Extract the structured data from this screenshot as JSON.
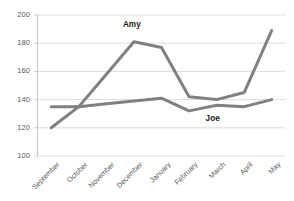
{
  "chart_data": {
    "type": "line",
    "title": "",
    "xlabel": "",
    "ylabel": "",
    "ylim": [
      100,
      200
    ],
    "yticks": [
      100,
      120,
      140,
      160,
      180,
      200
    ],
    "grid": "horizontal",
    "legend_position": "inline-annotations",
    "categories": [
      "September",
      "October",
      "November",
      "December",
      "January",
      "February",
      "March",
      "April",
      "May"
    ],
    "series": [
      {
        "name": "Amy",
        "color": "#808080",
        "values": [
          120,
          135,
          158,
          181,
          177,
          142,
          140,
          145,
          189
        ]
      },
      {
        "name": "Joe",
        "color": "#808080",
        "values": [
          135,
          135,
          137,
          139,
          141,
          132,
          136,
          135,
          140
        ]
      }
    ],
    "annotations": [
      {
        "text": "Amy",
        "x_category": "December",
        "value": 193
      },
      {
        "text": "Joe",
        "x_category": "March",
        "value": 126
      }
    ]
  },
  "axes": {
    "y_tick_labels": [
      "200",
      "180",
      "160",
      "140",
      "120",
      "100"
    ],
    "x_tick_labels": [
      "September",
      "October",
      "November",
      "December",
      "January",
      "February",
      "March",
      "April",
      "May"
    ]
  },
  "style": {
    "grid_color": "#d9d9d9",
    "axis_color": "#bfbfbf",
    "tick_text_color": "#595959",
    "series_color": "#808080",
    "background": "#ffffff"
  }
}
